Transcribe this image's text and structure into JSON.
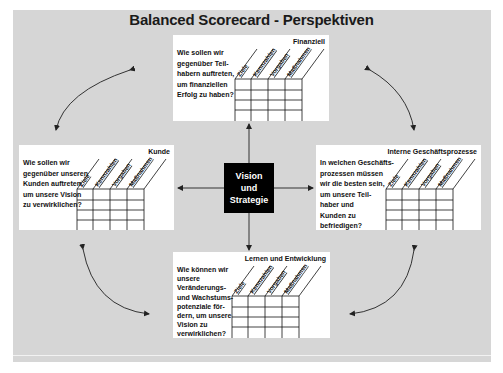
{
  "title": "Balanced Scorecard - Perspektiven",
  "center": {
    "lines": [
      "Vision",
      "und",
      "Strategie"
    ]
  },
  "columns": [
    "Ziele",
    "Kennzahlen",
    "Vorgaben",
    "Maßnahmen"
  ],
  "grid_rows": 4,
  "perspectives": {
    "finanziell": {
      "label": "Finanziell",
      "question_lines": [
        "Wie sollen wir",
        "gegenüber Teil-",
        "habern auftreten,",
        "um finanziellen",
        "Erfolg zu haben?"
      ]
    },
    "kunde": {
      "label": "Kunde",
      "question_lines": [
        "Wie sollen wir",
        "gegenüber unseren",
        "Kunden auftreten,",
        "um unsere Vision",
        "zu verwirklichen?"
      ]
    },
    "intern": {
      "label": "Interne Geschäftsprozesse",
      "question_lines": [
        "In welchen Geschäfts-",
        "prozessen müssen",
        "wir die besten sein,",
        "um unsere Teil-",
        "haber und",
        "Kunden zu",
        "befriedigen?"
      ]
    },
    "lernen": {
      "label": "Lernen und Entwicklung",
      "question_lines": [
        "Wie können wir",
        "unsere",
        "Veränderungs-",
        "und Wachstums-",
        "potenziale för-",
        "dern, um unsere",
        "Vision zu",
        "verwirklichen?"
      ]
    }
  },
  "colors": {
    "background": "#d6d6d6",
    "card": "#ffffff",
    "center_box": "#000000",
    "text": "#111111"
  }
}
